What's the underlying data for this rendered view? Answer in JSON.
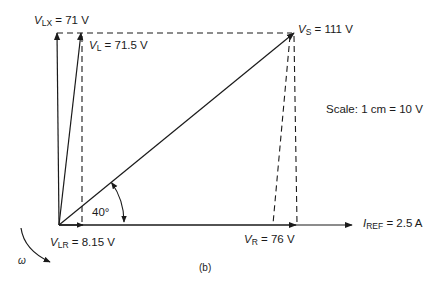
{
  "diagram": {
    "caption": "(b)",
    "scale_label": "Scale:  1 cm = 10 V",
    "angle_label": "40°",
    "omega_label": "ω",
    "phasors": {
      "V_LX": {
        "symbol": "V",
        "sub": "LX",
        "value": " = 71 V"
      },
      "V_L": {
        "symbol": "V",
        "sub": "L",
        "value": " = 71.5 V"
      },
      "V_S": {
        "symbol": "V",
        "sub": "S",
        "value": " = 111 V"
      },
      "V_LR": {
        "symbol": "V",
        "sub": "LR",
        "value": " = 8.15 V"
      },
      "V_R": {
        "symbol": "V",
        "sub": "R",
        "value": " = 76 V"
      },
      "I_REF": {
        "symbol": "I",
        "sub": "REF",
        "value": " = 2.5 A"
      }
    },
    "line_color": "#1a1a1a"
  }
}
